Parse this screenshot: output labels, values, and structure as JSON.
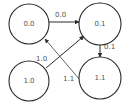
{
  "diagram": {
    "type": "state-transition-graph",
    "colors": {
      "stroke": "#2a2a2a",
      "text": "#555555",
      "background": "#ffffff"
    },
    "nodes": [
      {
        "id": "n00",
        "label": "0.0",
        "cx": 29,
        "cy": 24,
        "r": 20
      },
      {
        "id": "n01",
        "label": "0.1",
        "cx": 100,
        "cy": 24,
        "r": 21
      },
      {
        "id": "n10",
        "label": "1.0",
        "cx": 29,
        "cy": 81,
        "r": 20
      },
      {
        "id": "n11",
        "label": "1.1",
        "cx": 100,
        "cy": 78,
        "r": 21
      }
    ],
    "edges": [
      {
        "from": "0.0",
        "to": "0.1",
        "label": "0.0"
      },
      {
        "from": "0.1",
        "to": "1.1",
        "label": "0.1"
      },
      {
        "from": "1.0",
        "to": "0.1",
        "label": "1.0"
      },
      {
        "from": "1.1",
        "to": "0.0",
        "label": "1.1"
      }
    ]
  }
}
